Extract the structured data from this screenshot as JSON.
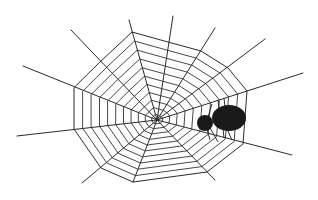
{
  "illustration": {
    "title": "Spider web with spider",
    "background": "#ffffff",
    "thread_color": "#2b2b2b",
    "spider_color": "#1a1a1a",
    "web": {
      "center": [
        157,
        120
      ],
      "ring_count": 11,
      "rays": [
        {
          "vertex": [
            100,
            62
          ],
          "end": [
            71,
            30
          ]
        },
        {
          "vertex": [
            132,
            32
          ],
          "end": [
            129,
            20
          ]
        },
        {
          "vertex": [
            168,
            42
          ],
          "end": [
            173,
            16
          ]
        },
        {
          "vertex": [
            201,
            51
          ],
          "end": [
            215,
            28
          ]
        },
        {
          "vertex": [
            228,
            68
          ],
          "end": [
            265,
            39
          ]
        },
        {
          "vertex": [
            247,
            91
          ],
          "end": [
            303,
            73
          ]
        },
        {
          "vertex": [
            243,
            144
          ],
          "end": [
            292,
            155
          ]
        },
        {
          "vertex": [
            207,
            172
          ],
          "end": [
            215,
            180
          ]
        },
        {
          "vertex": [
            133,
            182
          ],
          "end": [
            133,
            182
          ]
        },
        {
          "vertex": [
            101,
            168
          ],
          "end": [
            82,
            183
          ]
        },
        {
          "vertex": [
            74,
            129
          ],
          "end": [
            17,
            136
          ]
        },
        {
          "vertex": [
            74,
            88
          ],
          "end": [
            23,
            66
          ]
        }
      ]
    },
    "spider": {
      "head": {
        "cx": 205,
        "cy": 123,
        "r": 8
      },
      "abdomen": {
        "cx": 229,
        "cy": 118,
        "rx": 17,
        "ry": 13
      }
    }
  }
}
